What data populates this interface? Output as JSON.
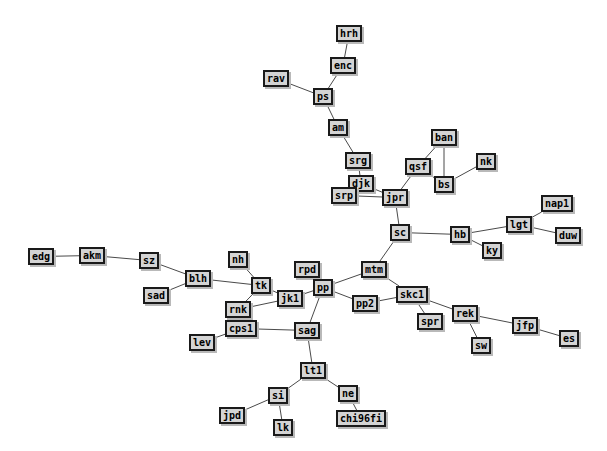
{
  "graph": {
    "title": "Network Graph",
    "background_color": "#ffffff",
    "node_fill_color": "#d4d4d4",
    "node_border_color": "#1a1a1a",
    "node_shadow_color": "#b9b9b9",
    "edge_color": "#4a4a4a",
    "edge_width": 1,
    "node_count": 45,
    "edge_count": 45,
    "nodes": [
      {
        "id": "hrh",
        "label": "hrh",
        "x": 336,
        "y": 25
      },
      {
        "id": "enc",
        "label": "enc",
        "x": 330,
        "y": 57
      },
      {
        "id": "rav",
        "label": "rav",
        "x": 263,
        "y": 70
      },
      {
        "id": "ps",
        "label": "ps",
        "x": 313,
        "y": 88
      },
      {
        "id": "am",
        "label": "am",
        "x": 328,
        "y": 119
      },
      {
        "id": "ban",
        "label": "ban",
        "x": 431,
        "y": 129
      },
      {
        "id": "srg",
        "label": "srg",
        "x": 345,
        "y": 152
      },
      {
        "id": "qsf",
        "label": "qsf",
        "x": 405,
        "y": 158
      },
      {
        "id": "nk",
        "label": "nk",
        "x": 476,
        "y": 153
      },
      {
        "id": "djk",
        "label": "djk",
        "x": 348,
        "y": 175
      },
      {
        "id": "bs",
        "label": "bs",
        "x": 434,
        "y": 176
      },
      {
        "id": "srp",
        "label": "srp",
        "x": 331,
        "y": 187
      },
      {
        "id": "jpr",
        "label": "jpr",
        "x": 382,
        "y": 189
      },
      {
        "id": "nap1",
        "label": "nap1",
        "x": 541,
        "y": 195
      },
      {
        "id": "lgt",
        "label": "lgt",
        "x": 506,
        "y": 216
      },
      {
        "id": "sc",
        "label": "sc",
        "x": 390,
        "y": 224
      },
      {
        "id": "hb",
        "label": "hb",
        "x": 450,
        "y": 226
      },
      {
        "id": "duw",
        "label": "duw",
        "x": 555,
        "y": 227
      },
      {
        "id": "ky",
        "label": "ky",
        "x": 482,
        "y": 242
      },
      {
        "id": "edg",
        "label": "edg",
        "x": 28,
        "y": 248
      },
      {
        "id": "akm",
        "label": "akm",
        "x": 79,
        "y": 247
      },
      {
        "id": "sz",
        "label": "sz",
        "x": 139,
        "y": 252
      },
      {
        "id": "nh",
        "label": "nh",
        "x": 228,
        "y": 251
      },
      {
        "id": "rpd",
        "label": "rpd",
        "x": 294,
        "y": 261
      },
      {
        "id": "blh",
        "label": "blh",
        "x": 185,
        "y": 270
      },
      {
        "id": "mtm",
        "label": "mtm",
        "x": 361,
        "y": 261
      },
      {
        "id": "tk",
        "label": "tk",
        "x": 251,
        "y": 277
      },
      {
        "id": "pp",
        "label": "pp",
        "x": 313,
        "y": 279
      },
      {
        "id": "sad",
        "label": "sad",
        "x": 143,
        "y": 287
      },
      {
        "id": "jk1",
        "label": "jk1",
        "x": 277,
        "y": 290
      },
      {
        "id": "skc1",
        "label": "skc1",
        "x": 396,
        "y": 286
      },
      {
        "id": "pp2",
        "label": "pp2",
        "x": 352,
        "y": 295
      },
      {
        "id": "rnk",
        "label": "rnk",
        "x": 225,
        "y": 301
      },
      {
        "id": "rek",
        "label": "rek",
        "x": 452,
        "y": 305
      },
      {
        "id": "cps1",
        "label": "cps1",
        "x": 225,
        "y": 320
      },
      {
        "id": "spr",
        "label": "spr",
        "x": 417,
        "y": 313
      },
      {
        "id": "jfp",
        "label": "jfp",
        "x": 512,
        "y": 317
      },
      {
        "id": "sag",
        "label": "sag",
        "x": 294,
        "y": 322
      },
      {
        "id": "es",
        "label": "es",
        "x": 559,
        "y": 330
      },
      {
        "id": "lev",
        "label": "lev",
        "x": 189,
        "y": 334
      },
      {
        "id": "sw",
        "label": "sw",
        "x": 471,
        "y": 337
      },
      {
        "id": "lt1",
        "label": "lt1",
        "x": 300,
        "y": 362
      },
      {
        "id": "ne",
        "label": "ne",
        "x": 338,
        "y": 385
      },
      {
        "id": "si",
        "label": "si",
        "x": 268,
        "y": 387
      },
      {
        "id": "jpd",
        "label": "jpd",
        "x": 219,
        "y": 407
      },
      {
        "id": "chi96fi",
        "label": "chi96fi",
        "x": 336,
        "y": 410
      },
      {
        "id": "lk",
        "label": "lk",
        "x": 273,
        "y": 419
      }
    ],
    "edges": [
      {
        "source": "hrh",
        "target": "enc"
      },
      {
        "source": "enc",
        "target": "ps"
      },
      {
        "source": "rav",
        "target": "ps"
      },
      {
        "source": "ps",
        "target": "am"
      },
      {
        "source": "am",
        "target": "srg"
      },
      {
        "source": "srg",
        "target": "djk"
      },
      {
        "source": "djk",
        "target": "jpr"
      },
      {
        "source": "srp",
        "target": "jpr"
      },
      {
        "source": "jpr",
        "target": "qsf"
      },
      {
        "source": "qsf",
        "target": "ban"
      },
      {
        "source": "qsf",
        "target": "bs"
      },
      {
        "source": "ban",
        "target": "bs"
      },
      {
        "source": "bs",
        "target": "nk"
      },
      {
        "source": "jpr",
        "target": "sc"
      },
      {
        "source": "sc",
        "target": "hb"
      },
      {
        "source": "hb",
        "target": "lgt"
      },
      {
        "source": "hb",
        "target": "ky"
      },
      {
        "source": "lgt",
        "target": "nap1"
      },
      {
        "source": "lgt",
        "target": "duw"
      },
      {
        "source": "sc",
        "target": "mtm"
      },
      {
        "source": "mtm",
        "target": "pp"
      },
      {
        "source": "mtm",
        "target": "skc1"
      },
      {
        "source": "pp",
        "target": "pp2"
      },
      {
        "source": "pp2",
        "target": "skc1"
      },
      {
        "source": "skc1",
        "target": "spr"
      },
      {
        "source": "skc1",
        "target": "rek"
      },
      {
        "source": "rek",
        "target": "sw"
      },
      {
        "source": "rek",
        "target": "jfp"
      },
      {
        "source": "jfp",
        "target": "es"
      },
      {
        "source": "edg",
        "target": "akm"
      },
      {
        "source": "akm",
        "target": "sz"
      },
      {
        "source": "sz",
        "target": "blh"
      },
      {
        "source": "sad",
        "target": "blh"
      },
      {
        "source": "blh",
        "target": "tk"
      },
      {
        "source": "nh",
        "target": "tk"
      },
      {
        "source": "tk",
        "target": "jk1"
      },
      {
        "source": "tk",
        "target": "rnk"
      },
      {
        "source": "jk1",
        "target": "pp"
      },
      {
        "source": "rpd",
        "target": "pp"
      },
      {
        "source": "rnk",
        "target": "jk1"
      },
      {
        "source": "rnk",
        "target": "cps1"
      },
      {
        "source": "cps1",
        "target": "lev"
      },
      {
        "source": "cps1",
        "target": "sag"
      },
      {
        "source": "pp",
        "target": "sag"
      },
      {
        "source": "sag",
        "target": "lt1"
      },
      {
        "source": "lt1",
        "target": "si"
      },
      {
        "source": "lt1",
        "target": "ne"
      },
      {
        "source": "si",
        "target": "jpd"
      },
      {
        "source": "si",
        "target": "lk"
      },
      {
        "source": "ne",
        "target": "chi96fi"
      }
    ]
  }
}
